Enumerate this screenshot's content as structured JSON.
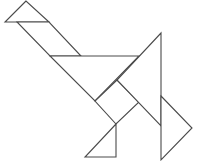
{
  "figure": {
    "stroke_color": "#4a4a4a",
    "fill_color": "#ffffff",
    "pieces": [
      {
        "name": "small-triangle-head",
        "points": "26,1 5,22 49,22"
      },
      {
        "name": "parallelogram-neck",
        "points": "17,22 49,22 81,56 50,56"
      },
      {
        "name": "large-triangle-body",
        "points": "50,56 139,56 95,101"
      },
      {
        "name": "square-body",
        "points": "95,101 117,80 139,102 116,124"
      },
      {
        "name": "large-triangle-wing",
        "points": "161,33 161,126 117,80"
      },
      {
        "name": "medium-triangle-tail",
        "points": "161,96 192,128 161,160"
      },
      {
        "name": "small-triangle-foot",
        "points": "116,124 85,157 116,157"
      }
    ]
  }
}
